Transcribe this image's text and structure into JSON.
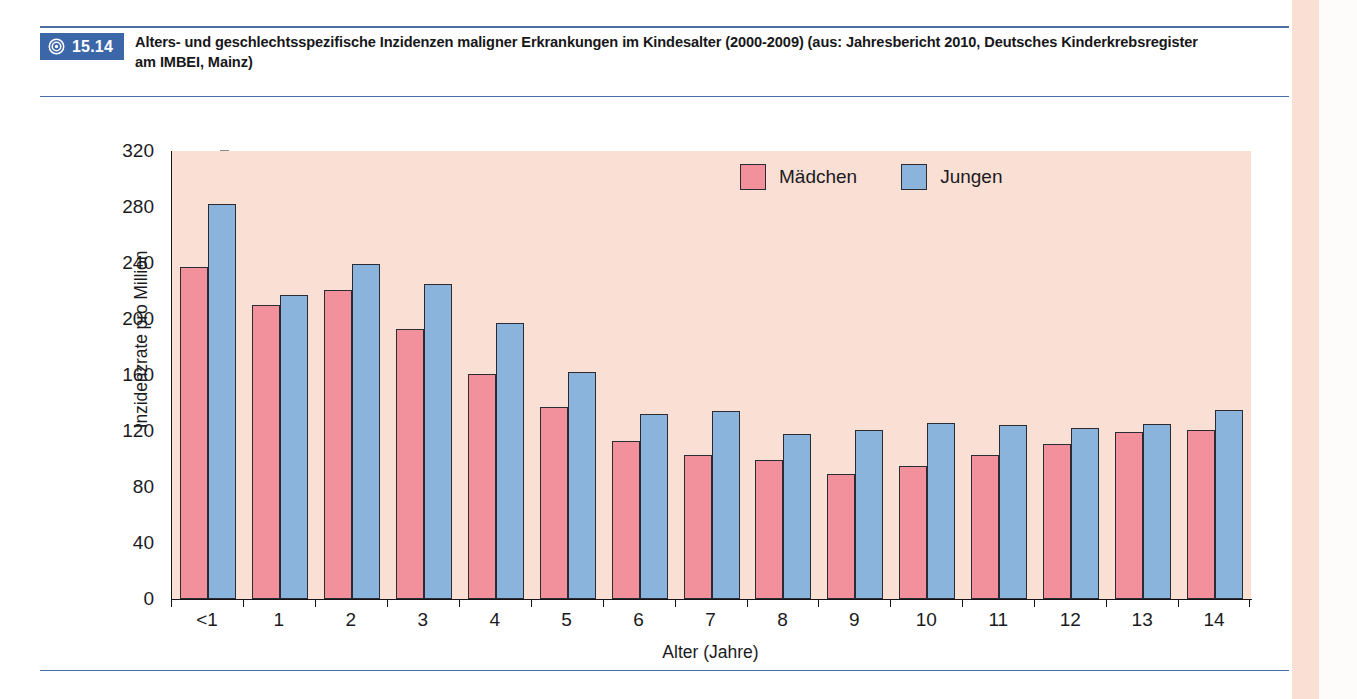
{
  "figure": {
    "badge_number": "15.14",
    "badge_icon": "bullseye-icon",
    "caption": "Alters- und geschlechtsspezifische Inzidenzen maligner Erkrankungen im Kindesalter (2000-2009) (aus: Jahresbericht 2010, Deutsches Kinderkrebsregister am IMBEI, Mainz)"
  },
  "colors": {
    "badge_blue": "#3b66a8",
    "rule_blue": "#4a6fa5",
    "girls_pink": "#f2919c",
    "boys_blue": "#8ab4dc",
    "plot_background": "#fadfd5"
  },
  "chart_data": {
    "type": "bar",
    "title": "",
    "xlabel": "Alter (Jahre)",
    "ylabel": "Inzidenzrate pro Million",
    "ylim": [
      0,
      320
    ],
    "yticks": [
      0,
      40,
      80,
      120,
      160,
      200,
      240,
      280,
      320
    ],
    "grid": false,
    "legend_position": "top-right",
    "categories": [
      "<1",
      "1",
      "2",
      "3",
      "4",
      "5",
      "6",
      "7",
      "8",
      "9",
      "10",
      "11",
      "12",
      "13",
      "14"
    ],
    "series": [
      {
        "name": "Mädchen",
        "color": "#f2919c",
        "values": [
          237,
          210,
          221,
          193,
          161,
          137,
          113,
          103,
          99,
          89,
          95,
          103,
          111,
          119,
          121
        ]
      },
      {
        "name": "Jungen",
        "color": "#8ab4dc",
        "values": [
          282,
          217,
          239,
          225,
          197,
          162,
          132,
          134,
          118,
          121,
          126,
          124,
          122,
          125,
          135
        ]
      }
    ]
  }
}
